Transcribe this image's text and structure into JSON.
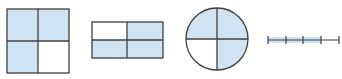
{
  "colors": {
    "shade": "#cfe3f3",
    "stroke": "#3f3f3f",
    "background": "#ffffff"
  },
  "figures": [
    {
      "name": "square",
      "parts": 4,
      "shaded": 3,
      "fraction": "3/4"
    },
    {
      "name": "rectangle",
      "parts": 4,
      "shaded": 3,
      "fraction": "3/4"
    },
    {
      "name": "circle",
      "parts": 4,
      "shaded": 3,
      "fraction": "3/4"
    },
    {
      "name": "number-line",
      "parts": 4,
      "shaded": 3,
      "fraction": "3/4"
    }
  ]
}
